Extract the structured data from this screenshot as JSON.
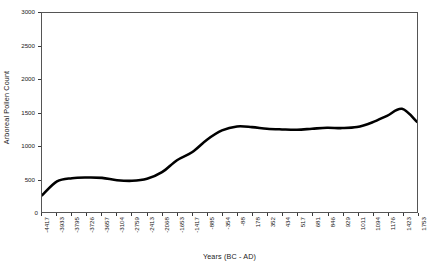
{
  "chart_data": {
    "type": "line",
    "title": "",
    "xlabel": "Years (BC - AD)",
    "ylabel": "Arboreal Pollen Count",
    "ylim": [
      0,
      3000
    ],
    "y_ticks": [
      0,
      500,
      1000,
      1500,
      2000,
      2500,
      3000
    ],
    "y_tick_labels": [
      "0",
      "500",
      "1000",
      "1500",
      "2000",
      "2500",
      "3000"
    ],
    "grid": false,
    "legend": "none",
    "line_color": "#000000",
    "line_width_px": 2.6,
    "categories": [
      "-4417",
      "-3933",
      "-3795",
      "-3726",
      "-3657",
      "-3104",
      "-2759",
      "-2413",
      "-2068",
      "-1653",
      "-1417",
      "-885",
      "-354",
      "-88",
      "178",
      "352",
      "434",
      "517",
      "681",
      "846",
      "929",
      "1011",
      "1094",
      "1176",
      "1423",
      "1753"
    ],
    "series": [
      {
        "name": "Arboreal Pollen Count",
        "values": [
          250,
          460,
          510,
          520,
          515,
          480,
          470,
          500,
          600,
          780,
          900,
          1090,
          1230,
          1290,
          1280,
          1255,
          1245,
          1240,
          1255,
          1270,
          1265,
          1280,
          1350,
          1450,
          1555,
          1360
        ]
      }
    ]
  }
}
